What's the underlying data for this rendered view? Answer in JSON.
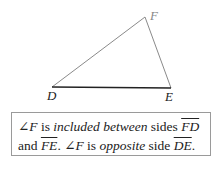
{
  "figure": {
    "vertices": {
      "D": {
        "label": "D",
        "x": 52,
        "y": 87
      },
      "E": {
        "label": "E",
        "x": 171,
        "y": 88
      },
      "F": {
        "label": "F",
        "x": 145,
        "y": 17
      }
    },
    "line_color": "#8a8a8a",
    "base_color": "#222222"
  },
  "caption": {
    "angle_symbol": "∠",
    "angle": "F",
    "t1": " is ",
    "t2": "included between",
    "t3": " sides ",
    "side1": "FD",
    "t4": "and ",
    "side2": "FE",
    "t5": ". ",
    "t6": " is ",
    "t7": "opposite",
    "t8": " side ",
    "side3": "DE",
    "t9": "."
  }
}
